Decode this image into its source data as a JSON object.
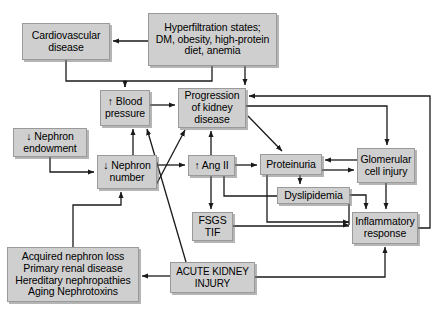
{
  "figure": {
    "background": "#ffffff",
    "node_fill": "#cfcfcf",
    "node_stroke": "#9a9a9a",
    "edge_color": "#1a1a1a"
  },
  "nodes": [
    {
      "id": "cardiovascular_disease",
      "label": "Cardiovascular\ndisease",
      "x": 22,
      "y": 23,
      "w": 88,
      "h": 37,
      "font": 10.5
    },
    {
      "id": "hyperfiltration_states",
      "label": "Hyperfiltration states;\nDM, obesity, high-protein\ndiet, anemia",
      "x": 148,
      "y": 13,
      "w": 129,
      "h": 53,
      "font": 10.5
    },
    {
      "id": "blood_pressure",
      "label": "↑ Blood\npressure",
      "x": 100,
      "y": 90,
      "w": 50,
      "h": 36,
      "font": 10.5
    },
    {
      "id": "progression_kidney_disease",
      "label": "Progression\nof kidney\ndisease",
      "x": 178,
      "y": 88,
      "w": 68,
      "h": 40,
      "font": 10.5
    },
    {
      "id": "nephron_endowment",
      "label": "↓ Nephron\nendowment",
      "x": 13,
      "y": 128,
      "w": 74,
      "h": 29,
      "font": 10.5
    },
    {
      "id": "nephron_number",
      "label": "↓ Nephron\nnumber",
      "x": 97,
      "y": 155,
      "w": 60,
      "h": 34,
      "font": 10.5
    },
    {
      "id": "ang_ii",
      "label": "↑ Ang II",
      "x": 188,
      "y": 155,
      "w": 47,
      "h": 21,
      "font": 10.5
    },
    {
      "id": "proteinuria",
      "label": "Proteinuria",
      "x": 260,
      "y": 154,
      "w": 62,
      "h": 21,
      "font": 10.5
    },
    {
      "id": "glomerular_cell_injury",
      "label": "Glomerular\ncell injury",
      "x": 357,
      "y": 148,
      "w": 58,
      "h": 35,
      "font": 10.5
    },
    {
      "id": "dyslipidemia",
      "label": "Dyslipidemia",
      "x": 277,
      "y": 187,
      "w": 73,
      "h": 17,
      "font": 10.5
    },
    {
      "id": "fsgs_tif",
      "label": "FSGS\nTIF",
      "x": 192,
      "y": 212,
      "w": 41,
      "h": 29,
      "font": 10.5
    },
    {
      "id": "inflammatory_response",
      "label": "Inflammatory\nresponse",
      "x": 352,
      "y": 212,
      "w": 66,
      "h": 32,
      "font": 10.5
    },
    {
      "id": "acute_kidney_injury",
      "label": "ACUTE KIDNEY\nINJURY",
      "x": 170,
      "y": 262,
      "w": 85,
      "h": 31,
      "font": 10
    },
    {
      "id": "acquired_nephron_loss",
      "label": "Acquired nephron loss\nPrimary renal disease\nHereditary nephropathies\nAging Nephrotoxins",
      "x": 7,
      "y": 247,
      "w": 132,
      "h": 55,
      "font": 10.5
    }
  ],
  "edges": [
    {
      "from": "hyperfiltration_states",
      "to": "cardiovascular_disease",
      "label": ""
    },
    {
      "from": "hyperfiltration_states",
      "to": "blood_pressure",
      "label": ""
    },
    {
      "from": "cardiovascular_disease",
      "to": "blood_pressure",
      "label": ""
    },
    {
      "from": "hyperfiltration_states",
      "to": "progression_kidney_disease",
      "label": ""
    },
    {
      "from": "blood_pressure",
      "to": "progression_kidney_disease",
      "label": ""
    },
    {
      "from": "nephron_endowment",
      "to": "nephron_number",
      "label": ""
    },
    {
      "from": "nephron_number",
      "to": "blood_pressure",
      "label": ""
    },
    {
      "from": "nephron_number",
      "to": "progression_kidney_disease",
      "label": ""
    },
    {
      "from": "nephron_number",
      "to": "ang_ii",
      "label": ""
    },
    {
      "from": "ang_ii",
      "to": "progression_kidney_disease",
      "label": ""
    },
    {
      "from": "ang_ii",
      "to": "proteinuria",
      "label": ""
    },
    {
      "from": "ang_ii",
      "to": "fsgs_tif",
      "label": ""
    },
    {
      "from": "ang_ii",
      "to": "inflammatory_response",
      "label": ""
    },
    {
      "from": "progression_kidney_disease",
      "to": "proteinuria",
      "label": ""
    },
    {
      "from": "progression_kidney_disease",
      "to": "glomerular_cell_injury",
      "label": ""
    },
    {
      "from": "proteinuria",
      "to": "glomerular_cell_injury",
      "label": ""
    },
    {
      "from": "glomerular_cell_injury",
      "to": "proteinuria",
      "label": ""
    },
    {
      "from": "proteinuria",
      "to": "dyslipidemia",
      "label": ""
    },
    {
      "from": "proteinuria",
      "to": "inflammatory_response",
      "label": ""
    },
    {
      "from": "dyslipidemia",
      "to": "inflammatory_response",
      "label": ""
    },
    {
      "from": "glomerular_cell_injury",
      "to": "inflammatory_response",
      "label": ""
    },
    {
      "from": "fsgs_tif",
      "to": "inflammatory_response",
      "label": ""
    },
    {
      "from": "inflammatory_response",
      "to": "progression_kidney_disease",
      "label": ""
    },
    {
      "from": "acute_kidney_injury",
      "to": "acquired_nephron_loss",
      "label": ""
    },
    {
      "from": "acute_kidney_injury",
      "to": "blood_pressure",
      "label": ""
    },
    {
      "from": "acute_kidney_injury",
      "to": "inflammatory_response",
      "label": ""
    },
    {
      "from": "acquired_nephron_loss",
      "to": "nephron_number",
      "label": ""
    }
  ]
}
